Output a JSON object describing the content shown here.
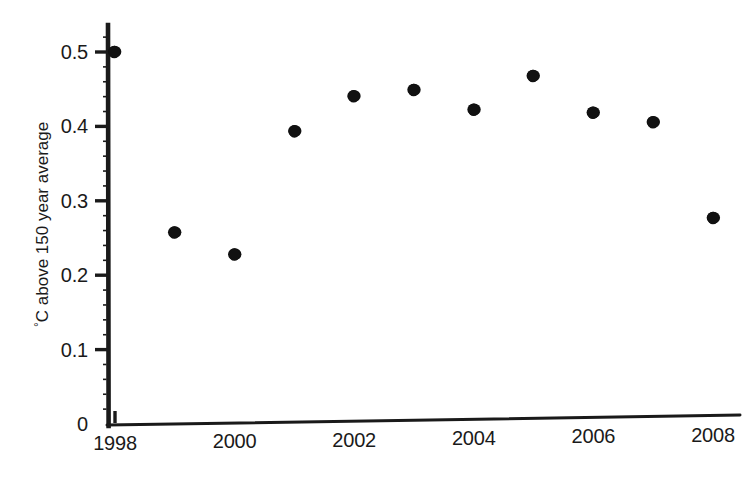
{
  "chart_data": {
    "type": "scatter",
    "title": "",
    "xlabel": "",
    "ylabel": "°C above 150 year average",
    "ylabel_prefix": "°",
    "ylabel_rest": "C above 150 year average",
    "x": [
      1998,
      1999,
      2000,
      2001,
      2002,
      2003,
      2004,
      2005,
      2006,
      2007,
      2008
    ],
    "values": [
      0.5,
      0.258,
      0.228,
      0.394,
      0.441,
      0.449,
      0.423,
      0.468,
      0.419,
      0.406,
      0.277
    ],
    "points": [
      {
        "year": 1998,
        "value": 0.5
      },
      {
        "year": 1999,
        "value": 0.258
      },
      {
        "year": 2000,
        "value": 0.228
      },
      {
        "year": 2001,
        "value": 0.394
      },
      {
        "year": 2002,
        "value": 0.441
      },
      {
        "year": 2003,
        "value": 0.449
      },
      {
        "year": 2004,
        "value": 0.423
      },
      {
        "year": 2005,
        "value": 0.468
      },
      {
        "year": 2006,
        "value": 0.419
      },
      {
        "year": 2007,
        "value": 0.406
      },
      {
        "year": 2008,
        "value": 0.277
      }
    ],
    "xlim": [
      1997.6,
      2008.7
    ],
    "ylim": [
      0,
      0.535
    ],
    "xticks": [
      1998,
      2000,
      2002,
      2004,
      2006,
      2008
    ],
    "xtick_labels": [
      "1998",
      "2000",
      "2002",
      "2004",
      "2006",
      "2008"
    ],
    "yticks": [
      0,
      0.1,
      0.2,
      0.3,
      0.4,
      0.5
    ],
    "ytick_labels": [
      "0",
      "0.1",
      "0.2",
      "0.3",
      "0.4",
      "0.5"
    ],
    "grid": false,
    "legend": null,
    "marker": "circle",
    "marker_color": "#111111",
    "marker_size": 13,
    "axis_color": "#1a1a1a",
    "background_color": "#ffffff"
  },
  "figure": {
    "width": 752,
    "height": 483
  }
}
